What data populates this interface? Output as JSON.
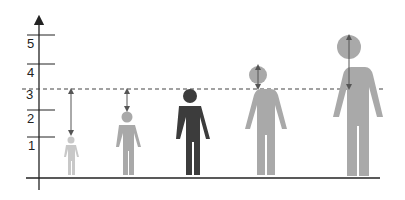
{
  "diagram": {
    "type": "height-comparison-figures",
    "y_axis": {
      "tick_labels": [
        "1",
        "2",
        "3",
        "4",
        "5"
      ]
    },
    "reference_line_label": "3",
    "figures": [
      {
        "index": 1,
        "shade": "light",
        "color": "#c8c8c8",
        "arrow": "down-from-line"
      },
      {
        "index": 2,
        "shade": "medium",
        "color": "#a9a9a9",
        "arrow": "down-from-line"
      },
      {
        "index": 3,
        "shade": "dark",
        "color": "#3c3c3c",
        "arrow": "none"
      },
      {
        "index": 4,
        "shade": "medium",
        "color": "#a9a9a9",
        "arrow": "up-above-line"
      },
      {
        "index": 5,
        "shade": "medium",
        "color": "#a9a9a9",
        "arrow": "up-above-line"
      }
    ],
    "colors": {
      "axis": "#222222",
      "dashed_line": "#444444",
      "arrow": "#555555"
    }
  }
}
